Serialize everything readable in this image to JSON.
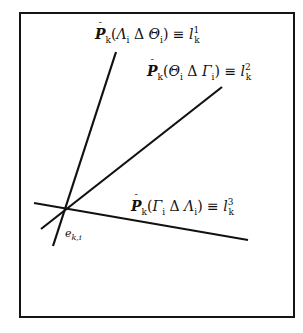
{
  "diagram": {
    "type": "three lines intersecting at a common point inside a bordered box",
    "frame": {
      "border_color": "#151515",
      "background": "#ffffff"
    },
    "lines": [
      {
        "id": "l1",
        "from": [
          116,
          52
        ],
        "to": [
          53,
          246
        ],
        "label": {
          "operator": "P",
          "subscript": "k",
          "arg_left": "Λ",
          "arg_left_sub": "i",
          "delta": "Δ",
          "arg_right": "Θ",
          "arg_right_sub": "i",
          "equiv": "≡",
          "rhs": "l",
          "rhs_sub": "k",
          "rhs_sup": "1"
        }
      },
      {
        "id": "l2",
        "from": [
          222,
          87
        ],
        "to": [
          41,
          229
        ],
        "label": {
          "operator": "P",
          "subscript": "k",
          "arg_left": "Θ",
          "arg_left_sub": "i",
          "delta": "Δ",
          "arg_right": "Γ",
          "arg_right_sub": "i",
          "equiv": "≡",
          "rhs": "l",
          "rhs_sub": "k",
          "rhs_sup": "2"
        }
      },
      {
        "id": "l3",
        "from": [
          34,
          203
        ],
        "to": [
          248,
          240
        ],
        "label": {
          "operator": "P",
          "subscript": "k",
          "arg_left": "Γ",
          "arg_left_sub": "i",
          "delta": "Δ",
          "arg_right": "Λ",
          "arg_right_sub": "i",
          "equiv": "≡",
          "rhs": "l",
          "rhs_sub": "k",
          "rhs_sup": "3"
        }
      }
    ],
    "intersection": {
      "label": "e",
      "label_sub": "k,i",
      "at": [
        67,
        208
      ]
    },
    "bar_glyph": "¯"
  }
}
